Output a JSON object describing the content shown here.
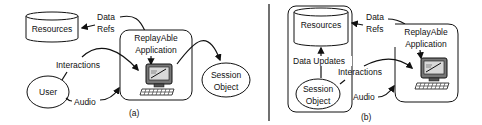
{
  "panel_a": {
    "resources": "Resources",
    "data_refs_line1": "Data",
    "data_refs_line2": "Refs",
    "app_line1": "ReplayAble",
    "app_line2": "Application",
    "session_line1": "Session",
    "session_line2": "Object",
    "user": "User",
    "interactions": "Interactions",
    "audio": "Audio",
    "caption": "(a)"
  },
  "panel_b": {
    "resources": "Resources",
    "data_refs_line1": "Data",
    "data_refs_line2": "Refs",
    "app_line1": "ReplayAble",
    "app_line2": "Application",
    "data_updates": "Data Updates",
    "interactions": "Interactions",
    "session_line1": "Session",
    "session_line2": "Object",
    "audio": "Audio",
    "caption": "(b)"
  }
}
